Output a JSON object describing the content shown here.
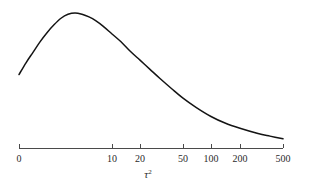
{
  "figure": {
    "name": "prior-density-plot",
    "background_color": "#ffffff",
    "curve_color": "#141414",
    "axis_color": "#4a4a4a"
  },
  "axis": {
    "label": "τ",
    "label_exponent": "2",
    "tick_labels": [
      "0",
      "10",
      "20",
      "50",
      "100",
      "200",
      "500"
    ],
    "tick_positions_px": [
      19,
      112,
      140,
      183,
      211,
      240,
      283
    ],
    "axis_y_px": 148,
    "axis_start_px": 19,
    "axis_end_px": 283
  },
  "chart_data": {
    "type": "line",
    "title": "",
    "subtitle": "",
    "xlabel": "τ²",
    "ylabel": "",
    "grid": false,
    "legend": null,
    "xscale": "log-like",
    "xticks": [
      0,
      10,
      20,
      50,
      100,
      200,
      500
    ],
    "xticklabels": [
      "0",
      "10",
      "20",
      "50",
      "100",
      "200",
      "500"
    ],
    "xlim": [
      0,
      500
    ],
    "ylim": [
      0,
      1
    ],
    "series": [
      {
        "name": "density",
        "comment": "Right-skewed unimodal density over tau-squared; x in tick-axis pixel space, y as normalized density (1 = plot top)",
        "x_px": [
          19,
          26,
          33,
          40,
          47,
          54,
          61,
          68,
          75,
          82,
          89,
          96,
          103,
          112,
          121,
          130,
          140,
          150,
          160,
          172,
          183,
          196,
          211,
          225,
          240,
          258,
          270,
          283
        ],
        "y_density": [
          0.53,
          0.62,
          0.7,
          0.78,
          0.85,
          0.91,
          0.96,
          0.99,
          1.0,
          0.99,
          0.97,
          0.94,
          0.9,
          0.84,
          0.78,
          0.71,
          0.64,
          0.57,
          0.5,
          0.42,
          0.35,
          0.28,
          0.21,
          0.16,
          0.12,
          0.08,
          0.06,
          0.04
        ]
      }
    ]
  }
}
